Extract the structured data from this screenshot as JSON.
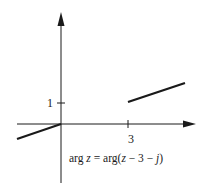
{
  "diagram": {
    "type": "complex-plane-locus",
    "axes": {
      "origin_px": [
        61,
        124
      ],
      "x_axis": {
        "from_px": [
          17,
          124
        ],
        "to_px": [
          196,
          124
        ],
        "arrow": true
      },
      "y_axis": {
        "from_px": [
          61,
          183
        ],
        "to_px": [
          61,
          12
        ],
        "arrow": true
      }
    },
    "ticks": [
      {
        "axis": "y",
        "value": 1,
        "label": "1",
        "pos_px": [
          61,
          103
        ]
      },
      {
        "axis": "x",
        "value": 3,
        "label": "3",
        "pos_px": [
          128,
          124
        ]
      }
    ],
    "rays": [
      {
        "name": "left-ray",
        "from_px": [
          61,
          124
        ],
        "to_px": [
          17,
          139
        ],
        "description": "half-line from origin in the third-quadrant direction"
      },
      {
        "name": "right-ray",
        "from_px": [
          128,
          102
        ],
        "to_px": [
          185,
          83
        ],
        "description": "half-line starting at 3 + j pointing away"
      }
    ],
    "equation": {
      "prefix": "arg ",
      "var1": "z",
      "mid": " = arg(",
      "var2": "z",
      "suffix1": " − 3 − ",
      "var3": "j",
      "suffix2": ")"
    },
    "colors": {
      "stroke": "#1a1a1a",
      "background": "#ffffff"
    }
  }
}
